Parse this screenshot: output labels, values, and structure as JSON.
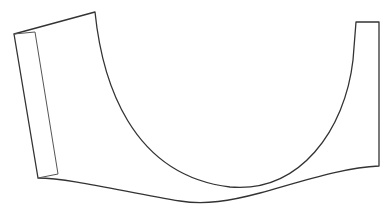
{
  "diagram": {
    "type": "line-drawing",
    "stroke_color": "#333333",
    "background": "#ffffff",
    "shapes": [
      {
        "name": "outer-outline",
        "label": ""
      },
      {
        "name": "side-panel-strip",
        "label": ""
      }
    ]
  }
}
